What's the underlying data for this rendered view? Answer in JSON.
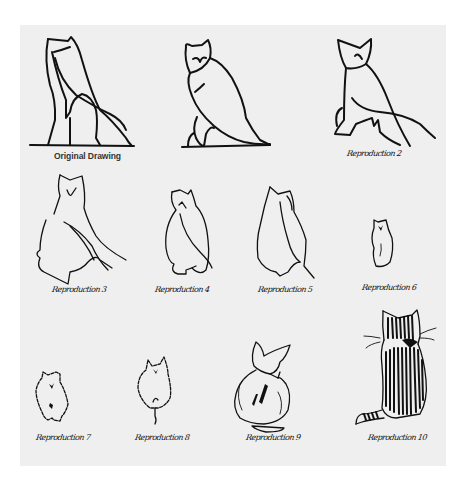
{
  "figure": {
    "background_color": "#efefef",
    "ink_color": "#111111",
    "panels": [
      {
        "id": "original",
        "label": "Original Drawing",
        "label_style": "printed",
        "depicts": "owl (Egyptian hieroglyph style)"
      },
      {
        "id": "r2",
        "label": "Reproduction 2",
        "label_style": "handwritten",
        "depicts": "owl"
      },
      {
        "id": "r3",
        "label": "Reproduction 2",
        "label_style": "handwritten",
        "depicts": "owl, more upright"
      },
      {
        "id": "r4",
        "label": "Reproduction 3",
        "label_style": "handwritten",
        "depicts": "owl/cat seated from behind"
      },
      {
        "id": "r5",
        "label": "Reproduction 4",
        "label_style": "handwritten",
        "depicts": "cat-like seated figure"
      },
      {
        "id": "r6",
        "label": "Reproduction 5",
        "label_style": "handwritten",
        "depicts": "cat-like seated figure"
      },
      {
        "id": "r7",
        "label": "Reproduction 6",
        "label_style": "handwritten",
        "depicts": "small furry cat"
      },
      {
        "id": "r8",
        "label": "Reproduction 7",
        "label_style": "handwritten",
        "depicts": "furry cat"
      },
      {
        "id": "r9",
        "label": "Reproduction 8",
        "label_style": "handwritten",
        "depicts": "furry cat with tail"
      },
      {
        "id": "r10",
        "label": "Reproduction 9",
        "label_style": "handwritten",
        "depicts": "cat with bow, from behind"
      },
      {
        "id": "r11",
        "label": "Reproduction 10",
        "label_style": "handwritten",
        "depicts": "striped cat with bow and curled tail, from behind"
      }
    ]
  },
  "labels": {
    "original": "Original Drawing",
    "r2": "Reproduction 2",
    "r3": "Reproduction 3",
    "r4": "Reproduction 4",
    "r5": "Reproduction 5",
    "r6": "Reproduction 6",
    "r7": "Reproduction 7",
    "r8": "Reproduction 8",
    "r9": "Reproduction 9",
    "r10": "Reproduction 10"
  }
}
